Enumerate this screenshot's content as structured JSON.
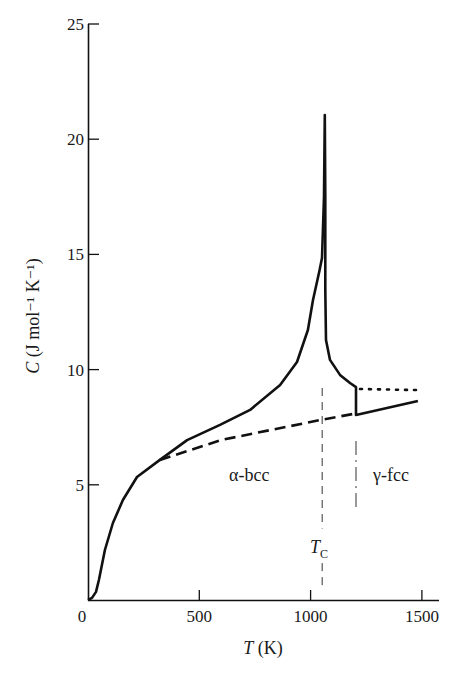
{
  "chart_data": {
    "type": "line",
    "title": "",
    "xlabel": "T (K)",
    "xlabel_parts": {
      "var": "T",
      "unit": " (K)"
    },
    "ylabel": "C (J mol⁻¹ K⁻¹)",
    "ylabel_parts": {
      "var": "C",
      "unit": " (J mol⁻¹ K⁻¹)"
    },
    "xlim": [
      0,
      1560
    ],
    "ylim": [
      0,
      25
    ],
    "x_ticks": [
      0,
      500,
      1000,
      1500
    ],
    "x_tick_labels": [
      "0",
      "500",
      "1000",
      "1500"
    ],
    "y_ticks": [
      5,
      10,
      15,
      20,
      25
    ],
    "y_tick_labels": [
      "5",
      "10",
      "15",
      "20",
      "25"
    ],
    "grid": false,
    "legend": null,
    "series": [
      {
        "name": "Measured heat capacity (solid)",
        "style": "solid",
        "points": [
          [
            0,
            0
          ],
          [
            18,
            0.09
          ],
          [
            36,
            0.35
          ],
          [
            49,
            0.87
          ],
          [
            67,
            1.74
          ],
          [
            76,
            2.17
          ],
          [
            112,
            3.34
          ],
          [
            157,
            4.34
          ],
          [
            220,
            5.34
          ],
          [
            323,
            6.08
          ],
          [
            445,
            6.94
          ],
          [
            593,
            7.6
          ],
          [
            728,
            8.25
          ],
          [
            863,
            9.33
          ],
          [
            939,
            10.33
          ],
          [
            988,
            11.72
          ],
          [
            1011,
            13.02
          ],
          [
            1040,
            14.3
          ],
          [
            1051,
            14.84
          ],
          [
            1060,
            17.5
          ],
          [
            1064,
            21.05
          ],
          [
            1066,
            17.5
          ],
          [
            1066,
            13.45
          ],
          [
            1069,
            11.28
          ],
          [
            1087,
            10.42
          ],
          [
            1132,
            9.77
          ],
          [
            1177,
            9.42
          ],
          [
            1204,
            9.24
          ],
          [
            1204,
            8.03
          ],
          [
            1482,
            8.64
          ]
        ]
      },
      {
        "name": "Lattice + electronic contribution (dashed)",
        "style": "dashed",
        "points": [
          [
            323,
            6.08
          ],
          [
            600,
            6.95
          ],
          [
            1042,
            7.81
          ],
          [
            1204,
            8.1
          ]
        ]
      },
      {
        "name": "Extrapolated α-bcc above γ transition (dotted)",
        "style": "dotted",
        "points": [
          [
            1222,
            9.16
          ],
          [
            1482,
            9.11
          ]
        ]
      }
    ],
    "annotations": [
      {
        "text": "α-bcc",
        "x": 640,
        "y": 5.4
      },
      {
        "text": "γ-fcc",
        "x": 1360,
        "y": 5.4
      },
      {
        "text": "T",
        "sub": "C",
        "x": 1050,
        "y": 2.3
      }
    ],
    "vlines": [
      {
        "name": "curie-temperature-line",
        "x": 1052,
        "y_from": 9.2,
        "y_to": 0.4,
        "gap": [
          1.6,
          3.1
        ],
        "style": "dashed"
      },
      {
        "name": "alpha-gamma-transition-line",
        "x": 1204,
        "y_from": 6.9,
        "y_to": 4.0,
        "style": "dashdot"
      }
    ],
    "labels": {
      "tc_var": "T",
      "tc_sub": "C",
      "alpha": "α-bcc",
      "gamma": "γ-fcc"
    }
  }
}
